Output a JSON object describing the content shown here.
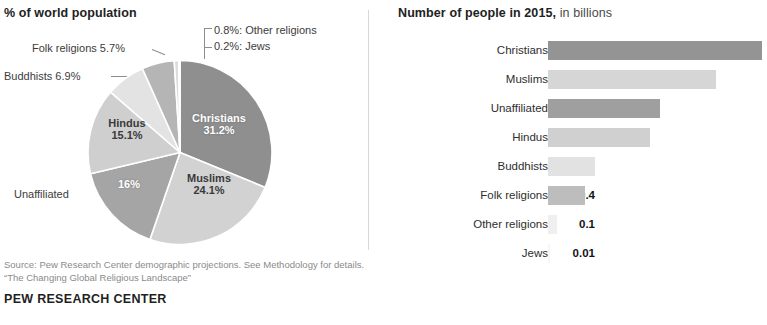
{
  "pie_panel": {
    "title": "% of world population",
    "callouts": [
      {
        "name": "Other religions",
        "value": "0.8%",
        "text": "0.8%: Other religions"
      },
      {
        "name": "Jews",
        "value": "0.2%",
        "text": "0.2%: Jews"
      },
      {
        "name": "Folk religions",
        "value": "5.7%",
        "text": "Folk religions 5.7%"
      },
      {
        "name": "Buddhists",
        "value": "6.9%",
        "text": "Buddhists 6.9%"
      },
      {
        "name": "Unaffiliated",
        "value": "16%",
        "text": "Unaffiliated"
      }
    ],
    "inner_labels": [
      {
        "name": "Christians",
        "value": "31.2%"
      },
      {
        "name": "Muslims",
        "value": "24.1%"
      },
      {
        "name": "Unaffiliated",
        "value": "16%"
      },
      {
        "name": "Hindus",
        "value": "15.1%"
      }
    ]
  },
  "bar_panel": {
    "title_bold": "Number of people in 2015,",
    "title_rest": " in billions"
  },
  "footer": {
    "source_line_1": "Source: Pew Research Center demographic projections. See Methodology for details.",
    "source_line_2": "“The Changing Global Religious Landscape”",
    "brand": "PEW RESEARCH CENTER"
  },
  "colors": {
    "christians": "#8f8f8f",
    "muslims": "#d2d2d2",
    "unaffiliated": "#a5a5a5",
    "hindus": "#cfcfcf",
    "buddhists": "#e3e3e3",
    "folk": "#b5b5b5",
    "other": "#dcdcdc",
    "jews": "#f0f0f0",
    "divider": "#d8d8d8",
    "text": "#2b2b2b",
    "muted": "#8a8a8a"
  },
  "chart_data": [
    {
      "type": "pie",
      "title": "% of world population",
      "unit": "percent of world population",
      "categories": [
        "Christians",
        "Muslims",
        "Unaffiliated",
        "Hindus",
        "Buddhists",
        "Folk religions",
        "Other religions",
        "Jews"
      ],
      "values": [
        31.2,
        24.1,
        16,
        15.1,
        6.9,
        5.7,
        0.8,
        0.2
      ],
      "value_labels": [
        "31.2%",
        "24.1%",
        "16%",
        "15.1%",
        "6.9%",
        "5.7%",
        "0.8%",
        "0.2%"
      ],
      "slice_colors": [
        "#8f8f8f",
        "#d2d2d2",
        "#a5a5a5",
        "#cfcfcf",
        "#e3e3e3",
        "#b5b5b5",
        "#dcdcdc",
        "#f0f0f0"
      ],
      "labels_inside": [
        "Christians",
        "Muslims",
        "Unaffiliated",
        "Hindus"
      ],
      "labels_outside": [
        "Buddhists",
        "Folk religions",
        "Other religions",
        "Jews"
      ],
      "start_angle_deg": 0,
      "direction": "clockwise",
      "legend": "none"
    },
    {
      "type": "bar",
      "orientation": "horizontal",
      "title": "Number of people in 2015, in billions",
      "xlabel": "billions of people",
      "ylabel": "",
      "grid": false,
      "legend": "none",
      "xlim": [
        0,
        2.5
      ],
      "categories": [
        "Christians",
        "Muslims",
        "Unaffiliated",
        "Hindus",
        "Buddhists",
        "Folk religions",
        "Other religions",
        "Jews"
      ],
      "values": [
        2.3,
        1.8,
        1.2,
        1.1,
        0.5,
        0.4,
        0.1,
        0.01
      ],
      "value_labels": [
        "2.3B",
        "1.8",
        "1.2",
        "1.1",
        "0.5",
        "0.4",
        "0.1",
        "0.01"
      ],
      "bar_colors": [
        "#949494",
        "#d6d6d6",
        "#9f9f9f",
        "#d0d0d0",
        "#e2e2e2",
        "#bdbdbd",
        "#efefef",
        "#f6f6f6"
      ]
    }
  ]
}
